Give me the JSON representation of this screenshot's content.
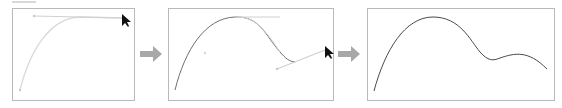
{
  "figure": {
    "steps": [
      {
        "id": 1,
        "label": "Initial curve with top handle being dragged"
      },
      {
        "id": 2,
        "label": "Curve with new anchor point and handle being dragged"
      },
      {
        "id": 3,
        "label": "Resulting final curve"
      }
    ],
    "colors": {
      "panel_border": "#b9b9b9",
      "arrow": "#a8a8a8",
      "curve_light": "#d9d9d9",
      "curve_dark": "#6e6e6e",
      "handle": "#cfcfcf",
      "cursor": "#111111"
    },
    "icons": {
      "step_arrow": "right-arrow-icon",
      "cursor": "mouse-pointer-icon"
    }
  }
}
